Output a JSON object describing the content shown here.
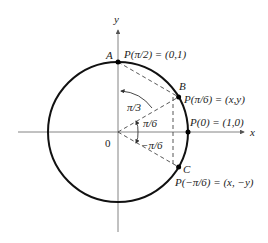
{
  "figure": {
    "center": [
      118,
      132
    ],
    "radius": 70,
    "axes": {
      "x_label": "x",
      "y_label": "y",
      "origin_label": "0"
    },
    "points": [
      {
        "id": "A",
        "label": "A",
        "description": "P(π/2) = (0,1)",
        "angle": "π/2"
      },
      {
        "id": "B",
        "label": "B",
        "description": "P(π/6) = (x,y)",
        "angle": "π/6"
      },
      {
        "id": "P0",
        "label": "",
        "description": "P(0) = (1,0)",
        "angle": "0"
      },
      {
        "id": "C",
        "label": "C",
        "description": "P(−π/6) = (x, −y)",
        "angle": "−π/6"
      }
    ],
    "angles": [
      {
        "label": "π/3"
      },
      {
        "label": "π/6"
      },
      {
        "label": "−π/6"
      }
    ],
    "colors": {
      "circle": "#111111",
      "axes": "#555555",
      "dashed": "#444444"
    }
  }
}
